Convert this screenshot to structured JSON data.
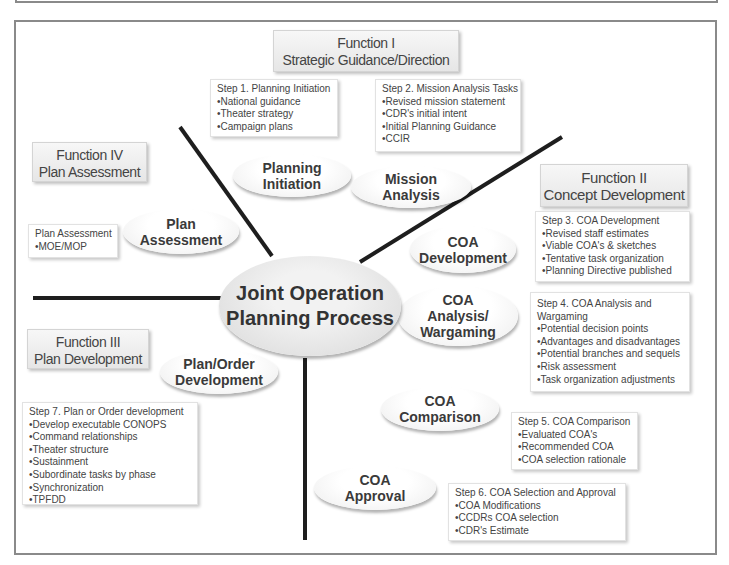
{
  "diagram": {
    "center": {
      "line1": "Joint Operation",
      "line2": "Planning Process"
    },
    "functions": [
      {
        "id": "I",
        "line1": "Function I",
        "line2": "Strategic Guidance/Direction"
      },
      {
        "id": "II",
        "line1": "Function II",
        "line2": "Concept Development"
      },
      {
        "id": "III",
        "line1": "Function III",
        "line2": "Plan Development"
      },
      {
        "id": "IV",
        "line1": "Function IV",
        "line2": "Plan Assessment"
      }
    ],
    "phases": [
      {
        "line1": "Planning",
        "line2": "Initiation"
      },
      {
        "line1": "Mission",
        "line2": "Analysis"
      },
      {
        "line1": "COA",
        "line2": "Development"
      },
      {
        "line1": "COA",
        "line2": "Analysis/",
        "line3": "Wargaming"
      },
      {
        "line1": "COA",
        "line2": "Comparison"
      },
      {
        "line1": "COA",
        "line2": "Approval"
      },
      {
        "line1": "Plan/Order",
        "line2": "Development"
      },
      {
        "line1": "Plan",
        "line2": "Assessment"
      }
    ],
    "steps": [
      {
        "title": "Step 1. Planning Initiation",
        "items": [
          "•National guidance",
          "•Theater strategy",
          "•Campaign plans"
        ]
      },
      {
        "title": "Step 2. Mission Analysis Tasks",
        "items": [
          "•Revised mission statement",
          "•CDR's initial intent",
          "•Initial Planning Guidance",
          "•CCIR"
        ]
      },
      {
        "title": "Step 3. COA Development",
        "items": [
          "•Revised staff estimates",
          "•Viable COA's & sketches",
          "•Tentative task organization",
          "•Planning Directive published"
        ]
      },
      {
        "title": "Step 4. COA Analysis and",
        "title2": "Wargaming",
        "items": [
          "•Potential decision points",
          "•Advantages and disadvantages",
          "•Potential branches and sequels",
          "•Risk assessment",
          "•Task organization adjustments"
        ]
      },
      {
        "title": "Step 5. COA Comparison",
        "items": [
          "•Evaluated COA's",
          "•Recommended COA",
          "•COA selection rationale"
        ]
      },
      {
        "title": "Step 6. COA Selection and Approval",
        "items": [
          "•COA Modifications",
          "•CCDRs COA selection",
          "•CDR's Estimate"
        ]
      },
      {
        "title": "Step 7. Plan or Order development",
        "items": [
          "•Develop executable CONOPS",
          "•Command relationships",
          "•Theater structure",
          "•Sustainment",
          "•Subordinate tasks by phase",
          "•Synchronization",
          "•TPFDD"
        ]
      },
      {
        "title": "Plan Assessment",
        "items": [
          "•MOE/MOP"
        ]
      }
    ],
    "colors": {
      "line": "#1e1e1e",
      "frame": "#8a8a8a",
      "box_bg": "#ececec"
    }
  }
}
